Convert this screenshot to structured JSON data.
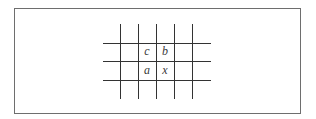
{
  "diagram": {
    "type": "grid",
    "frame": {
      "left": 14,
      "top": 8,
      "right": 301,
      "bottom": 114
    },
    "line_color": "#333333",
    "vertical_lines_x": [
      120,
      138,
      156,
      174,
      192
    ],
    "vertical_extent": [
      24,
      99
    ],
    "horizontal_lines_y": [
      43,
      61,
      80
    ],
    "horizontal_extent": [
      103,
      211
    ],
    "labels": {
      "c": "c",
      "b": "b",
      "a": "a",
      "x": "x"
    },
    "cells": [
      {
        "label": "c",
        "row": 0,
        "col": 1,
        "cx": 147,
        "cy": 52
      },
      {
        "label": "b",
        "row": 0,
        "col": 2,
        "cx": 165,
        "cy": 52
      },
      {
        "label": "a",
        "row": 1,
        "col": 1,
        "cx": 147,
        "cy": 71
      },
      {
        "label": "x",
        "row": 1,
        "col": 2,
        "cx": 165,
        "cy": 71
      }
    ]
  }
}
